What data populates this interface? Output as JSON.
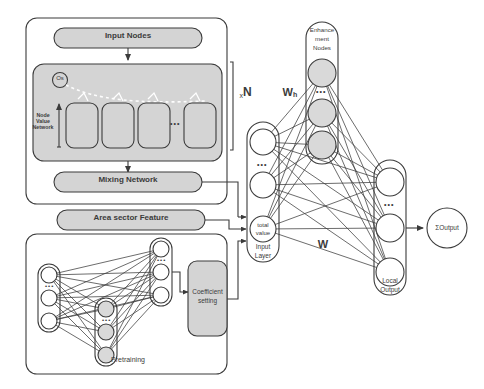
{
  "diagram": {
    "colors": {
      "stroke": "#3b3b3b",
      "fill_gray": "#d4d4d4",
      "fill_light": "#dedede",
      "node_gray": "#d9d9d9",
      "node_white": "#ffffff",
      "background": "#ffffff"
    }
  },
  "left_panel": {
    "input_nodes": {
      "label": "Input Nodes"
    },
    "node_value_network": {
      "label": "Node Value Network",
      "os_label": "Os",
      "cell_dots": "•••",
      "cell_count": 4
    },
    "mixing_network": {
      "label": "Mixing Network"
    },
    "repeat_label": {
      "prefix": "x",
      "value": "N"
    }
  },
  "area_sector": {
    "label": "Area sector Feature"
  },
  "pretraining": {
    "label": "Pretraining",
    "input_dots": "•••",
    "hidden_dots": "•••",
    "output_dots": "•••",
    "coefficient_setting": {
      "line1": "Coefficient",
      "line2": "setting"
    }
  },
  "broad_network": {
    "input_layer": {
      "line1": "Input",
      "line2": "Layer",
      "dots": "•••",
      "total_value": {
        "line1": "total",
        "line2": "value"
      }
    },
    "enhancement_nodes": {
      "line1": "Enhance",
      "line2": "ment",
      "line3": "Nodes",
      "dots": "•••"
    },
    "local_output": {
      "line1": "Local",
      "line2": "Output",
      "dots": "•••"
    },
    "weights": {
      "wh_base": "W",
      "wh_sub": "h",
      "w": "W"
    },
    "sum_output": {
      "label": "ΣOutput"
    }
  }
}
